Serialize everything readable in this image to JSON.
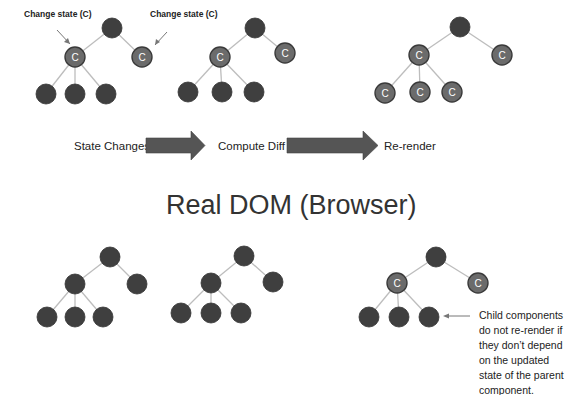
{
  "annotations": {
    "change_state_left": "Change state (C)",
    "change_state_right": "Change state (C)"
  },
  "flow": {
    "step1": "State Changes",
    "step2": "Compute Diff",
    "step3": "Re-render"
  },
  "section_title": "Real DOM (Browser)",
  "bottom_note": [
    "Child components",
    "do not re-render if",
    "they don’t depend",
    "on the updated",
    "state of the parent",
    "component."
  ],
  "node_marker": "C",
  "colors": {
    "dark_node": "#3f3f3f",
    "changed_node": "#6b6b6b",
    "edge": "#bdbdbd",
    "arrow": "#555555"
  },
  "trees": [
    {
      "id": "top-initial",
      "changed": [
        false,
        true,
        true,
        false,
        false,
        false
      ]
    },
    {
      "id": "top-diff",
      "changed": [
        false,
        true,
        true,
        false,
        false,
        false
      ]
    },
    {
      "id": "top-rerender",
      "changed": [
        false,
        true,
        true,
        true,
        true,
        true
      ]
    },
    {
      "id": "bottom-1",
      "changed": [
        false,
        false,
        false,
        false,
        false,
        false
      ]
    },
    {
      "id": "bottom-2",
      "changed": [
        false,
        false,
        false,
        false,
        false,
        false
      ]
    },
    {
      "id": "bottom-3",
      "changed": [
        false,
        true,
        true,
        false,
        false,
        false
      ]
    }
  ]
}
